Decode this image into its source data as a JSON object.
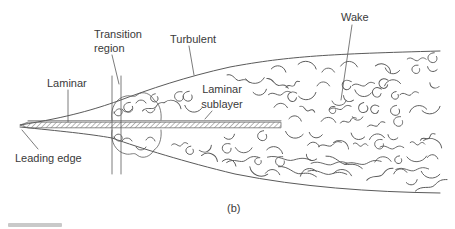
{
  "diagram": {
    "caption": "(b)",
    "labels": {
      "laminar": "Laminar",
      "transition_region": {
        "line1": "Transition",
        "line2": "region"
      },
      "turbulent": "Turbulent",
      "wake": "Wake",
      "laminar_sublayer": {
        "line1": "Laminar",
        "line2": "sublayer"
      },
      "leading_edge": "Leading edge"
    },
    "colors": {
      "line": "#5a5a5a",
      "text": "#3a3a3a",
      "background": "#ffffff"
    }
  }
}
